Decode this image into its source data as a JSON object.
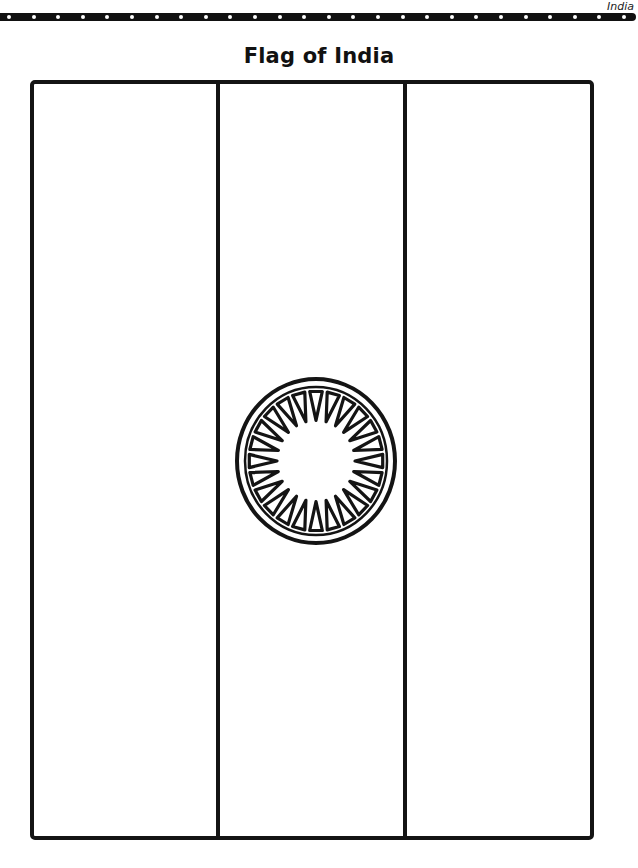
{
  "header": {
    "section_label": "India",
    "dot_count": 26
  },
  "page": {
    "title": "Flag of India"
  },
  "flag": {
    "stripes": [
      {
        "position": "left",
        "label": ""
      },
      {
        "position": "middle",
        "label": ""
      },
      {
        "position": "right",
        "label": ""
      }
    ],
    "emblem": {
      "name": "ashoka-chakra",
      "spoke_count": 24
    }
  },
  "colors": {
    "ink": "#141414",
    "paper": "#ffffff"
  }
}
